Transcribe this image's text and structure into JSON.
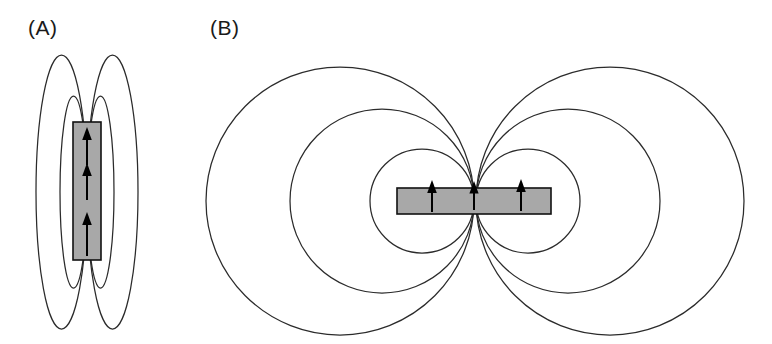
{
  "figure": {
    "caption_implicit": "Magnetic field line geometry for two magnet aspect ratios",
    "background_color": "#ffffff",
    "width": 772,
    "height": 344,
    "line_color": "#2b2b2b",
    "magnet_fill_color": "#a8a8a8",
    "magnet_stroke_color": "#111111",
    "arrow_color": "#000000",
    "label_color": "#1a1a1a"
  },
  "panels": [
    {
      "id": "panel-a",
      "label": "(A)",
      "label_x": 28,
      "label_y": 35,
      "description": "Tall narrow vertical magnet with elongated prolate field loops",
      "magnet": {
        "shape": "rect",
        "x": 73,
        "y": 122,
        "width": 28,
        "height": 138,
        "orientation": "vertical",
        "magnetization_direction": "up",
        "arrow_count": 3,
        "arrows": [
          {
            "cx": 87,
            "y_tail": 165,
            "y_head": 130
          },
          {
            "cx": 87,
            "y_tail": 200,
            "y_head": 166
          },
          {
            "cx": 87,
            "y_tail": 256,
            "y_head": 215
          }
        ]
      },
      "field_lines": {
        "count": 4,
        "type": "ellipse-lobes",
        "center_x": 87,
        "center_y": 192,
        "lobes": [
          {
            "side": "left",
            "rx": 25.5,
            "ry": 137,
            "cx": 61.5
          },
          {
            "side": "right",
            "rx": 25.5,
            "ry": 137,
            "cx": 112.5
          },
          {
            "side": "left",
            "rx": 13.5,
            "ry": 96,
            "cx": 73.5
          },
          {
            "side": "right",
            "rx": 13.5,
            "ry": 96,
            "cx": 100.5
          }
        ]
      }
    },
    {
      "id": "panel-b",
      "label": "(B)",
      "label_x": 210,
      "label_y": 35,
      "description": "Wide flat horizontal magnet with circular oblate field loops",
      "magnet": {
        "shape": "rect",
        "x": 397,
        "y": 188,
        "width": 154,
        "height": 26,
        "orientation": "horizontal",
        "magnetization_direction": "up",
        "arrow_count": 3,
        "arrows": [
          {
            "cx": 432,
            "y_tail": 212,
            "y_head": 182
          },
          {
            "cx": 474,
            "y_tail": 210,
            "y_head": 183
          },
          {
            "cx": 521,
            "y_tail": 211,
            "y_head": 180
          }
        ]
      },
      "field_lines": {
        "count": 6,
        "type": "circle-lobes",
        "center_y": 201,
        "tangent_x": 475,
        "lobes": [
          {
            "side": "left",
            "cx": 340,
            "cy": 201,
            "r": 134
          },
          {
            "side": "left",
            "cx": 382,
            "cy": 201,
            "r": 92
          },
          {
            "side": "left",
            "cx": 422,
            "cy": 201,
            "r": 52
          },
          {
            "side": "right",
            "cx": 610,
            "cy": 201,
            "r": 134
          },
          {
            "side": "right",
            "cx": 568,
            "cy": 201,
            "r": 92
          },
          {
            "side": "right",
            "cx": 528,
            "cy": 201,
            "r": 52
          }
        ]
      }
    }
  ]
}
